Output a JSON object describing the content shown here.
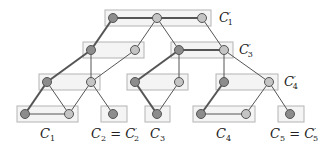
{
  "diagram": {
    "colors": {
      "box_fill": "#f4f4f4",
      "box_stroke": "#b4b4b4",
      "edge": "#555555",
      "node_dark": "#8c8c8c",
      "node_light": "#c4c4c4"
    },
    "labels": {
      "c1_prime": {
        "base": "C",
        "prime": "′",
        "sub": "1"
      },
      "c3_prime": {
        "base": "C",
        "prime": "′",
        "sub": "3"
      },
      "c4_prime": {
        "base": "C",
        "prime": "′",
        "sub": "4"
      },
      "c1": {
        "base": "C",
        "sub": "1"
      },
      "c2": {
        "base": "C",
        "sub": "2",
        "eq": " = ",
        "base2": "C",
        "prime2": "′",
        "sub2": "2"
      },
      "c3": {
        "base": "C",
        "sub": "3"
      },
      "c4": {
        "base": "C",
        "sub": "4"
      },
      "c5": {
        "base": "C",
        "sub": "5",
        "eq": " = ",
        "base2": "C",
        "prime2": "′",
        "sub2": "5"
      }
    },
    "levels": [
      {
        "name": "level-0",
        "clusters": [
          "C'1"
        ]
      },
      {
        "name": "level-1",
        "clusters": [
          "cluster-a",
          "C'3"
        ]
      },
      {
        "name": "level-2",
        "clusters": [
          "cluster-b",
          "cluster-c",
          "C'4"
        ]
      },
      {
        "name": "level-3",
        "clusters": [
          "C1",
          "C2 = C'2",
          "C3",
          "C4",
          "C5 = C'5"
        ]
      }
    ]
  }
}
